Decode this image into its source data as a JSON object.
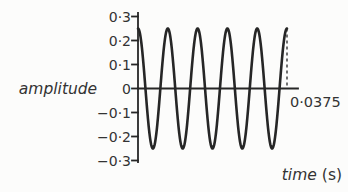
{
  "figure": {
    "ylabel": "amplitude",
    "xlabel_word": "time",
    "xlabel_unit": "(s)",
    "x_end_label": "0·0375"
  },
  "chart_data": {
    "type": "line",
    "title": "",
    "xlabel": "time (s)",
    "ylabel": "amplitude",
    "x_range_s": [
      0,
      0.0375
    ],
    "ylim": [
      -0.3,
      0.3
    ],
    "yticks": [
      0.3,
      0.2,
      0.1,
      0,
      -0.1,
      -0.2,
      -0.3
    ],
    "ytick_labels": [
      "0·3",
      "0·2",
      "0·1",
      "0",
      "−0·1",
      "−0·2",
      "−0·3"
    ],
    "xtick_labels": [
      "0·0375"
    ],
    "grid": false,
    "legend": false,
    "series": [
      {
        "name": "signal",
        "waveform": "cosine",
        "amplitude": 0.25,
        "cycles": 5,
        "period_s": 0.0075,
        "starts_at": "positive-peak"
      }
    ],
    "annotations": [
      {
        "type": "dashed-vline",
        "x_s": 0.0375,
        "from_y": 0.25,
        "to_y": 0,
        "label": "0·0375"
      }
    ],
    "colors": {
      "line": "#262626",
      "axis": "#262626",
      "text": "#333333",
      "background": "#fcfcfb"
    }
  }
}
